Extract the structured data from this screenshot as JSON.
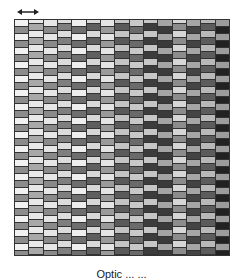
{
  "figure": {
    "arrow_icon": "double-headed-arrow",
    "caption": "Optic ... ...",
    "grid": {
      "columns": 15,
      "row_height_px": 7,
      "rows": 35,
      "column_shades": [
        [
          "#f2f2f2",
          "#8c8c8c"
        ],
        [
          "#a8a8a8",
          "#e8e8e8"
        ],
        [
          "#e6e6e6",
          "#8a8a8a"
        ],
        [
          "#7f7f7f",
          "#dcdcdc"
        ],
        [
          "#eeeeee",
          "#6e6e6e"
        ],
        [
          "#5e5e5e",
          "#d8d8d8"
        ],
        [
          "#e4e4e4",
          "#9a9a9a"
        ],
        [
          "#5a5a5a",
          "#c4c4c4"
        ],
        [
          "#c8c8c8",
          "#6a6a6a"
        ],
        [
          "#3c3c3c",
          "#c6c6c6"
        ],
        [
          "#a4a4a4",
          "#3a3a3a"
        ],
        [
          "#8c8c8c",
          "#d6d6d6"
        ],
        [
          "#a6a6a6",
          "#444444"
        ],
        [
          "#5c5c5c",
          "#b8b8b8"
        ],
        [
          "#9c9c9c",
          "#222222"
        ]
      ],
      "column_offsets": [
        0,
        3.5,
        0,
        3.5,
        0,
        3.5,
        0,
        3.5,
        0,
        3.5,
        0,
        3.5,
        0,
        3.5,
        0
      ]
    }
  }
}
